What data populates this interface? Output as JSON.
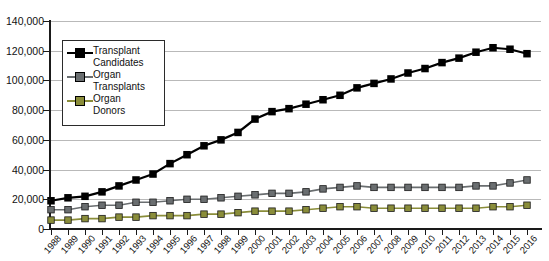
{
  "chart_data": {
    "type": "line",
    "title": "",
    "xlabel": "",
    "ylabel": "",
    "ylim": [
      0,
      140000
    ],
    "ytick_labels": [
      "0",
      "20,000",
      "40,000",
      "60,000",
      "80,000",
      "100,000",
      "120,000",
      "140,000"
    ],
    "ytick_values": [
      0,
      20000,
      40000,
      60000,
      80000,
      100000,
      120000,
      140000
    ],
    "grid": true,
    "legend_position": "upper-left-inside",
    "categories": [
      "1988",
      "1989",
      "1990",
      "1991",
      "1992",
      "1993",
      "1994",
      "1995",
      "1996",
      "1997",
      "1998",
      "1999",
      "2000",
      "2001",
      "2002",
      "2003",
      "2004",
      "2005",
      "2006",
      "2007",
      "2008",
      "2009",
      "2010",
      "2011",
      "2012",
      "2013",
      "2014",
      "2015",
      "2016"
    ],
    "series": [
      {
        "name": "Transplant Candidates",
        "color": "#000000",
        "marker": "square",
        "values": [
          19000,
          21000,
          22000,
          25000,
          29000,
          33000,
          37000,
          44000,
          50000,
          56000,
          60000,
          65000,
          74000,
          79000,
          81000,
          84000,
          87000,
          90000,
          95000,
          98000,
          101000,
          105000,
          108000,
          112000,
          115000,
          119000,
          122000,
          121000,
          118000
        ]
      },
      {
        "name": "Organ Transplants",
        "color": "#6a6e70",
        "marker": "square",
        "values": [
          13000,
          13000,
          15000,
          16000,
          16000,
          18000,
          18000,
          19000,
          20000,
          20000,
          21000,
          22000,
          23000,
          24000,
          24000,
          25000,
          27000,
          28000,
          29000,
          28000,
          28000,
          28000,
          28000,
          28000,
          28000,
          29000,
          29000,
          31000,
          33000
        ]
      },
      {
        "name": "Organ Donors",
        "color": "#8a8d3a",
        "marker": "square",
        "values": [
          6000,
          6000,
          7000,
          7000,
          8000,
          8000,
          9000,
          9000,
          9000,
          10000,
          10000,
          11000,
          12000,
          12000,
          12000,
          13000,
          14000,
          15000,
          15000,
          14000,
          14000,
          14000,
          14000,
          14000,
          14000,
          14000,
          15000,
          15000,
          16000
        ]
      }
    ]
  },
  "legend": {
    "items": [
      {
        "label_line1": "Transplant",
        "label_line2": "Candidates"
      },
      {
        "label_line1": "Organ",
        "label_line2": "Transplants"
      },
      {
        "label_line1": "Organ",
        "label_line2": "Donors"
      }
    ]
  }
}
